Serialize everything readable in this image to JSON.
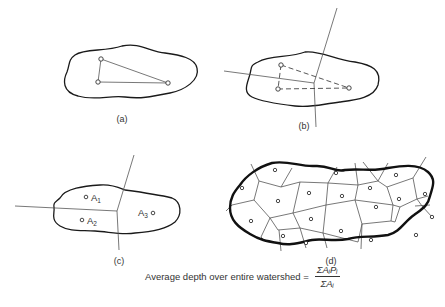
{
  "figure": {
    "panels": [
      {
        "id": "a",
        "label": "(a)",
        "description": "Watershed boundary with three rain gauge stations connected by triangle"
      },
      {
        "id": "b",
        "label": "(b)",
        "description": "Perpendicular bisectors of dashed triangle sides meeting at a point"
      },
      {
        "id": "c",
        "label": "(c)",
        "description": "Thiessen polygons dividing watershed into areas",
        "areas": [
          "A1",
          "A2",
          "A3"
        ]
      },
      {
        "id": "d",
        "label": "(d)",
        "description": "Thiessen polygon network for many stations over watershed"
      }
    ],
    "area_labels": {
      "a1": "A",
      "a1_sub": "1",
      "a2": "A",
      "a2_sub": "2",
      "a3": "A",
      "a3_sub": "3"
    },
    "formula": {
      "text": "Average depth over entire watershed =",
      "numerator": "ΣAᵢPᵢ",
      "denominator": "ΣAᵢ"
    }
  }
}
